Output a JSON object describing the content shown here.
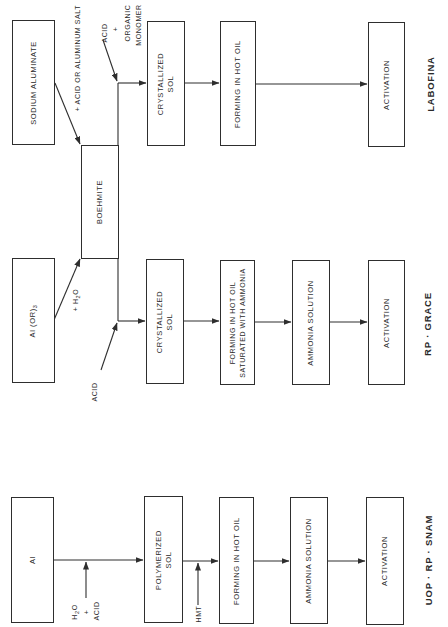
{
  "diagram": {
    "processes": [
      {
        "name": "LABOFINA",
        "start": "SODIUM ALUMINATE",
        "start_reagent": "+ ACID OR ALUMINUM SALT",
        "steps": [
          "CRYSTALLIZED SOL",
          "FORMING IN HOT OIL",
          "ACTIVATION"
        ],
        "branch_reagent": [
          "ACID",
          "+",
          "ORGANIC",
          "MONOMER"
        ]
      },
      {
        "name": "RP · GRACE",
        "start": "Al (OR)3",
        "start_reagent": "+ H2O",
        "steps": [
          "CRYSTALLIZED SOL",
          "FORMING IN HOT OIL SATURATED WITH AMMONIA",
          "AMMONIA SOLUTION",
          "ACTIVATION"
        ],
        "branch_reagent": [
          "ACID"
        ]
      },
      {
        "name": "UOP · RP · SNAM",
        "start": "Al",
        "start_reagent": [
          "H2O",
          "+",
          "ACID"
        ],
        "steps": [
          "POLYMERIZED SOL",
          "FORMING IN HOT OIL",
          "AMMONIA SOLUTION",
          "ACTIVATION"
        ],
        "step_reagent": "HMT"
      }
    ],
    "shared_intermediate": "BOEHMITE"
  },
  "labels": {
    "labofina": {
      "title": "LABOFINA",
      "sodium_aluminate": "SODIUM ALUMINATE",
      "acid_or_al_salt": "+ ACID OR ALUMINUM SALT",
      "acid": "ACID",
      "plus": "+",
      "organic": "ORGANIC",
      "monomer": "MONOMER",
      "cryst_1": "CRYSTALLIZED",
      "cryst_2": "SOL",
      "forming": "FORMING IN HOT OIL",
      "activation": "ACTIVATION"
    },
    "boehmite": "BOEHMITE",
    "grace": {
      "title": "RP · GRACE",
      "alkoxide_main": "Al (OR)",
      "alkoxide_sub": "3",
      "water_prefix": "+ H",
      "water_sub": "2",
      "water_suffix": "O",
      "acid": "ACID",
      "cryst_1": "CRYSTALLIZED",
      "cryst_2": "SOL",
      "forming_1": "FORMING IN HOT OIL",
      "forming_2": "SATURATED WITH AMMONIA",
      "ammonia": "AMMONIA SOLUTION",
      "activation": "ACTIVATION"
    },
    "snam": {
      "title": "UOP · RP · SNAM",
      "al": "Al",
      "h2o_prefix": "H",
      "h2o_sub": "2",
      "h2o_suffix": "O",
      "plus": "+",
      "acid": "ACID",
      "poly_1": "POLYMERIZED",
      "poly_2": "SOL",
      "hmt": "HMT",
      "forming": "FORMING IN HOT OIL",
      "ammonia": "AMMONIA SOLUTION",
      "activation": "ACTIVATION"
    }
  },
  "colors": {
    "line": "#2e2e2e",
    "background": "#ffffff"
  }
}
